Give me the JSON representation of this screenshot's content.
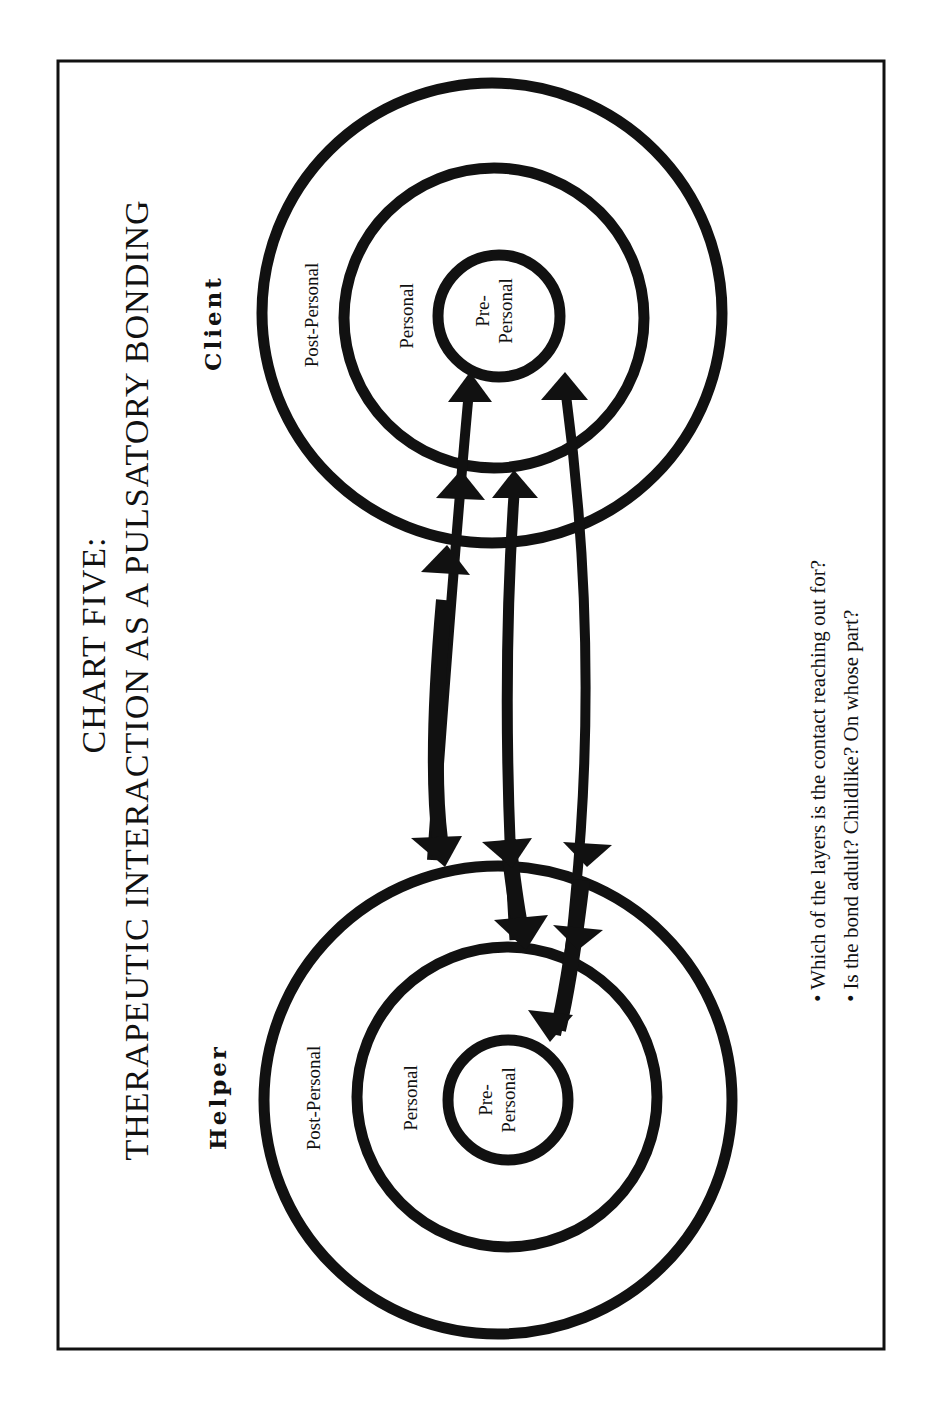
{
  "page": {
    "running_head": ""
  },
  "chart": {
    "title_line1": "CHART FIVE:",
    "title_line2": "THERAPEUTIC INTERACTION AS A PULSATORY BONDING"
  },
  "parties": {
    "helper": {
      "label": "Helper",
      "layers": {
        "outer": "Post-Personal",
        "middle": "Personal",
        "inner_line1": "Pre-",
        "inner_line2": "Personal"
      }
    },
    "client": {
      "label": "Client",
      "layers": {
        "outer": "Post-Personal",
        "middle": "Personal",
        "inner_line1": "Pre-",
        "inner_line2": "Personal"
      }
    }
  },
  "questions": [
    "• Which of the layers is the contact reaching out for?",
    "• Is the bond adult? Childlike? On whose part?"
  ],
  "arrows": [
    {
      "name": "post-personal-to-pre-personal",
      "from": "Helper Post-Personal",
      "to": "Client Pre-Personal"
    },
    {
      "name": "personal-to-personal",
      "from": "Helper Personal",
      "to": "Client Personal"
    },
    {
      "name": "pre-personal-to-pre-personal",
      "from": "Helper Pre-Personal",
      "to": "Client Pre-Personal"
    }
  ],
  "colors": {
    "ink": "#111111",
    "paper": "#ffffff"
  }
}
